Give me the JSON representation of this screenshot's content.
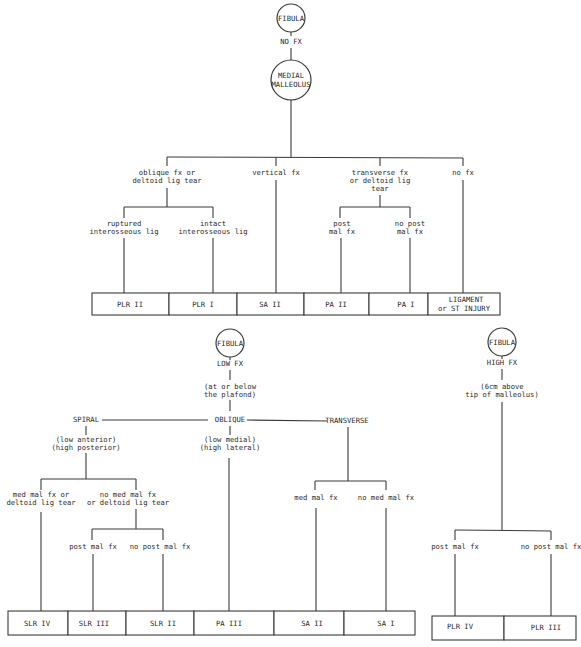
{
  "top_tree": {
    "root": {
      "label": "FIBULA",
      "edge_label": "NO FX"
    },
    "node": {
      "label_lines": [
        "MEDIAL",
        "MALLEOLUS"
      ]
    },
    "branches": [
      {
        "label_lines": [
          "oblique fx or",
          "deltoid lig tear"
        ]
      },
      {
        "label_lines": [
          "vertical fx"
        ]
      },
      {
        "label_lines": [
          "transverse fx",
          "or deltoid lig",
          "tear"
        ]
      },
      {
        "label_lines": [
          "no fx"
        ]
      }
    ],
    "sub_branches": [
      {
        "label_lines": [
          "ruptured",
          "interosseous lig"
        ]
      },
      {
        "label_lines": [
          "intact",
          "interosseous lig"
        ]
      },
      {
        "label_lines": [
          "post",
          "mal fx"
        ]
      },
      {
        "label_lines": [
          "no post",
          "mal fx"
        ]
      }
    ],
    "outcomes": [
      {
        "lines": [
          "PLR II"
        ]
      },
      {
        "lines": [
          "PLR I"
        ]
      },
      {
        "lines": [
          "SA II"
        ]
      },
      {
        "lines": [
          "PA II"
        ]
      },
      {
        "lines": [
          "PA I"
        ]
      },
      {
        "lines": [
          "LIGAMENT",
          "or ST INJURY"
        ]
      }
    ]
  },
  "low_tree": {
    "root": {
      "label": "FIBULA",
      "edge_label": "LOW FX"
    },
    "note_lines": [
      "(at or below",
      "the plafond)"
    ],
    "types": [
      {
        "label": "SPIRAL",
        "note_lines": [
          "(low anterior)",
          "(high posterior)"
        ]
      },
      {
        "label": "OBLIQUE",
        "note_lines": [
          "(low medial)",
          "(high lateral)"
        ]
      },
      {
        "label": "TRANSVERSE",
        "note_lines": []
      }
    ],
    "spiral_branches": [
      {
        "label_lines": [
          "med mal fx or",
          "deltoid lig tear"
        ]
      },
      {
        "label_lines": [
          "no med mal fx",
          "or deltoid lig tear"
        ]
      }
    ],
    "spiral_sub_branches": [
      {
        "label_lines": [
          "post mal fx"
        ]
      },
      {
        "label_lines": [
          "no post mal fx"
        ]
      }
    ],
    "transverse_branches": [
      {
        "label_lines": [
          "med mal fx"
        ]
      },
      {
        "label_lines": [
          "no med mal fx"
        ]
      }
    ],
    "outcomes": [
      {
        "lines": [
          "SLR IV"
        ]
      },
      {
        "lines": [
          "SLR III"
        ]
      },
      {
        "lines": [
          "SLR II"
        ]
      },
      {
        "lines": [
          "PA III"
        ]
      },
      {
        "lines": [
          "SA II"
        ]
      },
      {
        "lines": [
          "SA I"
        ]
      }
    ]
  },
  "high_tree": {
    "root": {
      "label": "FIBULA",
      "edge_label": "HIGH FX"
    },
    "note_lines": [
      "(6cm above",
      "tip of malleolus)"
    ],
    "branches": [
      {
        "label_lines": [
          "post mal fx"
        ]
      },
      {
        "label_lines": [
          "no post mal fx"
        ]
      }
    ],
    "outcomes": [
      {
        "lines": [
          "PLR IV"
        ]
      },
      {
        "lines": [
          "PLR III"
        ]
      }
    ]
  }
}
